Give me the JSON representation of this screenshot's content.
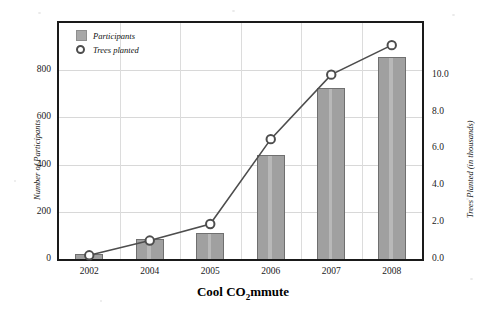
{
  "chart_data": {
    "type": "bar",
    "title": "Cool CO2mmute",
    "title_parts": {
      "before": "Cool CO",
      "subscript": "2",
      "after": "mmute"
    },
    "categories": [
      "2002",
      "2004",
      "2005",
      "2006",
      "2007",
      "2008"
    ],
    "xlabel": "",
    "grid": true,
    "legend_position": "top-left",
    "series": [
      {
        "name": "Participants",
        "type": "bar",
        "axis": "left",
        "color": "#a0a0a0",
        "values": [
          20,
          85,
          110,
          440,
          725,
          855
        ]
      },
      {
        "name": "Trees planted",
        "type": "line",
        "axis": "right",
        "color": "#4d4d4d",
        "marker": "open-circle",
        "values": [
          0.2,
          1.0,
          1.9,
          6.5,
          10.0,
          11.6
        ]
      }
    ],
    "axes": {
      "left": {
        "label": "Number of Participants",
        "ticks": [
          "0",
          "200",
          "400",
          "600",
          "800"
        ],
        "tick_values": [
          0,
          200,
          400,
          600,
          800
        ],
        "ylim": [
          0,
          1000
        ]
      },
      "right": {
        "label": "Trees Planted (in thousands)",
        "ticks": [
          "0.0",
          "2.0",
          "4.0",
          "6.0",
          "8.0",
          "10.0"
        ],
        "tick_values": [
          0.0,
          2.0,
          4.0,
          6.0,
          8.0,
          10.0
        ],
        "ylim": [
          0,
          12.8
        ]
      }
    }
  },
  "legend": {
    "items": [
      {
        "label": "Participants",
        "marker": "gray-square-swatch"
      },
      {
        "label": "Trees planted",
        "marker": "open-circle-icon"
      }
    ]
  }
}
